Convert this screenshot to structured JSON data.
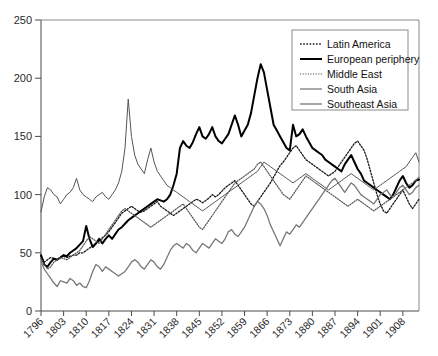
{
  "chart_data": {
    "type": "line",
    "title": "",
    "subtitle": "",
    "xlabel": "",
    "ylabel": "",
    "xlim": [
      1796,
      1913
    ],
    "ylim": [
      0,
      250
    ],
    "grid": false,
    "legend_position": "top-right",
    "y_ticks": [
      0,
      50,
      100,
      150,
      200,
      250
    ],
    "y_tick_labels": [
      "0",
      "50",
      "100",
      "150",
      "200",
      "250"
    ],
    "x_ticks": [
      1796,
      1803,
      1810,
      1817,
      1824,
      1831,
      1838,
      1845,
      1852,
      1859,
      1866,
      1873,
      1880,
      1887,
      1894,
      1901,
      1908
    ],
    "x_tick_labels": [
      "1796",
      "1803",
      "1810",
      "1817",
      "1824",
      "1831",
      "1838",
      "1845",
      "1852",
      "1859",
      "1866",
      "1873",
      "1880",
      "1887",
      "1894",
      "1901",
      "1908"
    ],
    "x": [
      1796,
      1797,
      1798,
      1799,
      1800,
      1801,
      1802,
      1803,
      1804,
      1805,
      1806,
      1807,
      1808,
      1809,
      1810,
      1811,
      1812,
      1813,
      1814,
      1815,
      1816,
      1817,
      1818,
      1819,
      1820,
      1821,
      1822,
      1823,
      1824,
      1825,
      1826,
      1827,
      1828,
      1829,
      1830,
      1831,
      1832,
      1833,
      1834,
      1835,
      1836,
      1837,
      1838,
      1839,
      1840,
      1841,
      1842,
      1843,
      1844,
      1845,
      1846,
      1847,
      1848,
      1849,
      1850,
      1851,
      1852,
      1853,
      1854,
      1855,
      1856,
      1857,
      1858,
      1859,
      1860,
      1861,
      1862,
      1863,
      1864,
      1865,
      1866,
      1867,
      1868,
      1869,
      1870,
      1871,
      1872,
      1873,
      1874,
      1875,
      1876,
      1877,
      1878,
      1879,
      1880,
      1881,
      1882,
      1883,
      1884,
      1885,
      1886,
      1887,
      1888,
      1889,
      1890,
      1891,
      1892,
      1893,
      1894,
      1895,
      1896,
      1897,
      1898,
      1899,
      1900,
      1901,
      1902,
      1903,
      1904,
      1905,
      1906,
      1907,
      1908,
      1909,
      1910,
      1911,
      1912,
      1913
    ],
    "series": [
      {
        "name": "Latin America",
        "style": "dotted",
        "color": "#1a1a1a",
        "width": 1.3,
        "values": [
          47,
          42,
          44,
          46,
          45,
          44,
          46,
          47,
          46,
          47,
          48,
          48,
          50,
          50,
          52,
          54,
          56,
          58,
          60,
          63,
          65,
          68,
          72,
          76,
          80,
          84,
          86,
          88,
          90,
          88,
          86,
          85,
          86,
          88,
          90,
          92,
          94,
          90,
          88,
          86,
          84,
          82,
          84,
          86,
          88,
          90,
          92,
          94,
          96,
          95,
          93,
          95,
          97,
          100,
          98,
          100,
          103,
          106,
          108,
          110,
          112,
          108,
          104,
          100,
          96,
          92,
          90,
          94,
          98,
          102,
          106,
          110,
          115,
          120,
          125,
          128,
          132,
          136,
          140,
          142,
          138,
          134,
          130,
          128,
          126,
          124,
          122,
          120,
          118,
          116,
          118,
          120,
          124,
          128,
          132,
          136,
          140,
          144,
          146,
          142,
          138,
          130,
          120,
          110,
          100,
          92,
          86,
          84,
          88,
          92,
          96,
          100,
          104,
          98,
          92,
          88,
          92,
          96
        ]
      },
      {
        "name": "European periphery",
        "style": "solid-bold",
        "color": "#000000",
        "width": 2.0,
        "values": [
          48,
          40,
          38,
          42,
          45,
          44,
          46,
          48,
          47,
          50,
          52,
          54,
          57,
          60,
          73,
          62,
          55,
          58,
          62,
          58,
          62,
          65,
          62,
          66,
          70,
          72,
          75,
          78,
          80,
          82,
          84,
          86,
          88,
          90,
          92,
          94,
          96,
          95,
          94,
          96,
          100,
          108,
          118,
          140,
          146,
          142,
          140,
          145,
          152,
          158,
          150,
          148,
          152,
          158,
          150,
          146,
          144,
          148,
          152,
          160,
          168,
          160,
          150,
          155,
          160,
          170,
          185,
          200,
          212,
          205,
          190,
          175,
          160,
          155,
          150,
          145,
          140,
          138,
          160,
          150,
          152,
          156,
          150,
          145,
          140,
          138,
          136,
          134,
          130,
          128,
          126,
          124,
          122,
          120,
          126,
          130,
          134,
          128,
          122,
          118,
          112,
          110,
          108,
          106,
          104,
          102,
          100,
          98,
          96,
          100,
          106,
          112,
          116,
          110,
          106,
          108,
          112,
          113
        ]
      },
      {
        "name": "Middle East",
        "style": "dotted-fine",
        "color": "#555555",
        "width": 1.2,
        "values": [
          45,
          40,
          36,
          38,
          42,
          44,
          46,
          45,
          44,
          46,
          48,
          50,
          52,
          56,
          60,
          64,
          62,
          60,
          58,
          62,
          66,
          70,
          74,
          78,
          82,
          86,
          88,
          86,
          84,
          82,
          80,
          78,
          76,
          74,
          72,
          74,
          76,
          78,
          80,
          82,
          84,
          86,
          88,
          90,
          92,
          88,
          84,
          80,
          76,
          72,
          70,
          74,
          78,
          82,
          86,
          90,
          94,
          98,
          102,
          106,
          110,
          112,
          114,
          116,
          118,
          120,
          122,
          126,
          128,
          124,
          120,
          116,
          112,
          108,
          104,
          100,
          98,
          96,
          100,
          104,
          108,
          112,
          116,
          114,
          112,
          110,
          108,
          106,
          104,
          102,
          100,
          98,
          96,
          94,
          92,
          90,
          92,
          94,
          96,
          94,
          92,
          90,
          88,
          86,
          88,
          90,
          92,
          94,
          96,
          98,
          100,
          102,
          104,
          106,
          108,
          110,
          112,
          115
        ]
      },
      {
        "name": "South Asia",
        "style": "solid-thin",
        "color": "#555555",
        "width": 1.0,
        "values": [
          85,
          98,
          106,
          104,
          100,
          98,
          92,
          96,
          100,
          102,
          106,
          114,
          104,
          100,
          98,
          96,
          94,
          98,
          100,
          102,
          98,
          96,
          100,
          104,
          110,
          120,
          140,
          182,
          150,
          134,
          126,
          122,
          118,
          130,
          140,
          128,
          120,
          116,
          112,
          108,
          106,
          104,
          102,
          100,
          98,
          96,
          94,
          92,
          90,
          88,
          86,
          88,
          90,
          92,
          94,
          96,
          98,
          100,
          102,
          104,
          106,
          108,
          110,
          112,
          114,
          116,
          118,
          120,
          124,
          128,
          126,
          124,
          122,
          120,
          118,
          116,
          114,
          112,
          110,
          112,
          114,
          116,
          118,
          116,
          114,
          112,
          110,
          108,
          106,
          104,
          106,
          108,
          110,
          112,
          114,
          116,
          118,
          116,
          114,
          112,
          110,
          108,
          106,
          104,
          106,
          108,
          110,
          112,
          114,
          116,
          118,
          120,
          122,
          124,
          128,
          132,
          136,
          128
        ]
      },
      {
        "name": "Southeast Asia",
        "style": "solid-thin-grey",
        "color": "#777777",
        "width": 1.3,
        "values": [
          43,
          36,
          32,
          28,
          24,
          21,
          26,
          25,
          24,
          28,
          26,
          22,
          24,
          21,
          20,
          26,
          34,
          40,
          38,
          34,
          38,
          36,
          34,
          32,
          30,
          32,
          34,
          38,
          42,
          44,
          42,
          38,
          36,
          40,
          44,
          42,
          38,
          36,
          40,
          46,
          52,
          56,
          58,
          56,
          54,
          58,
          56,
          52,
          50,
          54,
          58,
          56,
          54,
          58,
          62,
          60,
          58,
          62,
          68,
          70,
          66,
          64,
          68,
          72,
          78,
          84,
          90,
          94,
          92,
          88,
          82,
          74,
          68,
          62,
          56,
          62,
          68,
          66,
          70,
          74,
          72,
          76,
          80,
          84,
          88,
          92,
          96,
          100,
          104,
          108,
          112,
          114,
          110,
          106,
          102,
          106,
          110,
          108,
          104,
          100,
          98,
          96,
          94,
          92,
          96,
          100,
          102,
          104,
          100,
          98,
          102,
          106,
          108,
          104,
          100,
          102,
          106,
          108
        ]
      }
    ]
  },
  "legend": {
    "items": [
      {
        "label": "Latin America"
      },
      {
        "label": "European periphery"
      },
      {
        "label": "Middle East"
      },
      {
        "label": "South Asia"
      },
      {
        "label": "Southeast Asia"
      }
    ]
  }
}
